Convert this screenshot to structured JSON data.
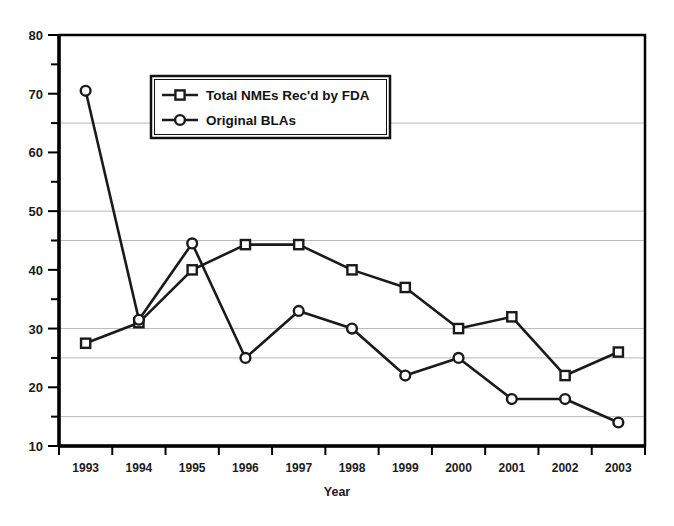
{
  "chart_data": {
    "type": "line",
    "title": "",
    "xlabel": "Year",
    "ylabel": "",
    "categories": [
      "1993",
      "1994",
      "1995",
      "1996",
      "1997",
      "1998",
      "1999",
      "2000",
      "2001",
      "2002",
      "2003"
    ],
    "series": [
      {
        "name": "Total NMEs Rec'd by FDA",
        "marker": "square",
        "values": [
          27.5,
          31,
          40,
          44.3,
          44.3,
          40,
          37,
          30,
          32,
          22,
          26
        ]
      },
      {
        "name": "Original BLAs",
        "marker": "circle",
        "values": [
          70.5,
          31.5,
          44.5,
          25,
          33,
          30,
          22,
          25,
          18,
          18,
          14
        ]
      }
    ],
    "ylim": [
      10,
      80
    ],
    "y_major_ticks": [
      10,
      20,
      30,
      40,
      50,
      60,
      70,
      80
    ],
    "y_minor_ticks": [
      15,
      25,
      35,
      45,
      55,
      65,
      75
    ],
    "y_tick_labels": [
      "10",
      "20",
      "30",
      "40",
      "50",
      "60",
      "70",
      "80"
    ],
    "gridlines": [
      15,
      25,
      30,
      45,
      50,
      65
    ],
    "grid": true,
    "legend_position": "upper-left-inside",
    "colors": {
      "line": "#1a1a1a",
      "grid": "#b9b9b9",
      "axis": "#000000",
      "background": "#ffffff",
      "marker_fill": "#ffffff"
    }
  },
  "legend": {
    "items": [
      {
        "label": "Total NMEs Rec'd by FDA",
        "marker": "square"
      },
      {
        "label": "Original BLAs",
        "marker": "circle"
      }
    ]
  },
  "axis": {
    "x_title": "Year"
  }
}
